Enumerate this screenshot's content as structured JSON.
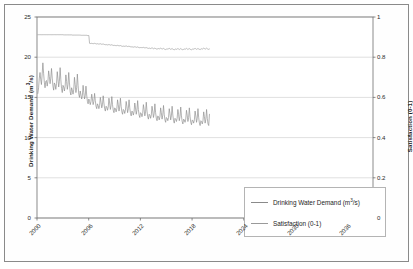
{
  "chart_data": {
    "type": "line",
    "title": "",
    "subtitle": "",
    "xlabel": "",
    "ylabel": "Drinking Water Demand (m³/s)",
    "ylabel_secondary": "Satisfaction (0-1)",
    "grid": true,
    "grid_axis": "y",
    "legend_position": "inside-bottom-right",
    "xlim": [
      2000,
      2039
    ],
    "ylim": [
      0,
      25
    ],
    "ylim_secondary": [
      0,
      1
    ],
    "yticks": [
      0,
      5,
      10,
      15,
      20,
      25
    ],
    "ytick_labels": [
      "0",
      "5",
      "10",
      "15",
      "20",
      "25"
    ],
    "yticks_secondary": [
      0,
      0.2,
      0.4,
      0.6,
      0.8,
      1
    ],
    "ytick_labels_secondary": [
      "0",
      "0.2",
      "0.4",
      "0.6",
      "0.8",
      "1"
    ],
    "xticks": [
      2000,
      2006,
      2012,
      2018,
      2024,
      2030,
      2036
    ],
    "xtick_labels": [
      "2000",
      "2006",
      "2012",
      "2018",
      "2024",
      "2030",
      "2036"
    ],
    "series": [
      {
        "name": "Drinking Water Demand (m³/s)",
        "axis": "left",
        "color": "#8a8a8a",
        "units": "m3/s",
        "x_start": 2000.1,
        "x_step": 0.08333,
        "note": "monthly values, strong annual seasonality, declining trend",
        "values": [
          15.5,
          16.2,
          17.4,
          18.1,
          17.2,
          16.6,
          17.9,
          19.3,
          18.0,
          16.9,
          16.2,
          17.0,
          17.1,
          16.4,
          17.0,
          18.3,
          17.6,
          16.7,
          17.4,
          18.6,
          17.4,
          16.4,
          15.9,
          16.8,
          16.6,
          16.0,
          16.7,
          18.2,
          17.3,
          16.3,
          17.0,
          18.7,
          17.2,
          16.1,
          15.6,
          16.5,
          16.3,
          15.8,
          16.4,
          17.8,
          17.0,
          16.0,
          16.6,
          18.1,
          16.8,
          15.7,
          15.3,
          16.2,
          15.9,
          15.4,
          16.0,
          17.5,
          16.6,
          15.6,
          16.2,
          17.9,
          16.5,
          15.4,
          15.0,
          15.8,
          15.3,
          14.8,
          15.2,
          16.5,
          15.6,
          14.8,
          15.2,
          16.4,
          15.3,
          14.5,
          14.2,
          14.8,
          14.5,
          14.1,
          14.5,
          15.4,
          14.8,
          14.1,
          14.5,
          15.5,
          14.6,
          13.9,
          13.6,
          14.2,
          14.0,
          13.6,
          14.0,
          15.0,
          14.4,
          13.7,
          14.1,
          15.2,
          14.3,
          13.6,
          13.3,
          13.9,
          13.8,
          13.4,
          13.8,
          14.9,
          14.3,
          13.5,
          14.0,
          15.1,
          14.1,
          13.4,
          13.1,
          13.7,
          13.6,
          13.2,
          13.6,
          14.7,
          14.1,
          13.3,
          13.8,
          14.9,
          13.9,
          13.2,
          12.9,
          13.5,
          13.4,
          13.0,
          13.4,
          14.5,
          13.9,
          13.1,
          13.6,
          14.7,
          13.7,
          13.0,
          12.7,
          13.3,
          13.2,
          12.8,
          13.2,
          14.3,
          13.7,
          12.9,
          13.4,
          14.6,
          13.5,
          12.8,
          12.5,
          13.1,
          13.0,
          12.6,
          13.0,
          14.1,
          13.5,
          12.7,
          13.2,
          14.4,
          13.3,
          12.6,
          12.3,
          12.9,
          12.8,
          12.4,
          12.8,
          13.9,
          13.3,
          12.5,
          13.0,
          14.2,
          13.1,
          12.4,
          12.1,
          12.7,
          12.6,
          12.2,
          12.6,
          13.7,
          13.1,
          12.3,
          12.8,
          14.0,
          12.9,
          12.2,
          11.9,
          12.5,
          12.4,
          12.1,
          12.5,
          13.6,
          13.0,
          12.2,
          12.7,
          13.9,
          12.8,
          12.1,
          11.8,
          12.4,
          12.3,
          12.0,
          12.4,
          13.5,
          12.9,
          12.1,
          12.6,
          13.8,
          12.7,
          12.0,
          11.7,
          12.3,
          12.2,
          11.9,
          12.3,
          13.4,
          12.8,
          12.0,
          12.5,
          13.7,
          12.6,
          11.9,
          11.6,
          12.2,
          12.1,
          11.8,
          12.2,
          13.3,
          12.7,
          11.9,
          12.4,
          13.6,
          12.5,
          11.8,
          11.5,
          12.1,
          12.0,
          11.7,
          12.1,
          13.2,
          12.6,
          11.8,
          12.3,
          13.5,
          12.4,
          11.7,
          11.5,
          12.9
        ]
      },
      {
        "name": "Satisfaction (0-1)",
        "axis": "right",
        "color": "#9a9a9a",
        "units": "0-1",
        "x_start": 2000.1,
        "x_step": 0.08333,
        "note": "near 0.91 flat until ~2005.8, step down to ~0.87, slow decline with small annual ripple settling near 0.84",
        "values": [
          0.912,
          0.912,
          0.912,
          0.912,
          0.912,
          0.912,
          0.912,
          0.912,
          0.912,
          0.912,
          0.912,
          0.912,
          0.912,
          0.912,
          0.912,
          0.912,
          0.912,
          0.912,
          0.912,
          0.912,
          0.912,
          0.912,
          0.912,
          0.912,
          0.912,
          0.912,
          0.912,
          0.912,
          0.912,
          0.912,
          0.912,
          0.912,
          0.912,
          0.912,
          0.912,
          0.912,
          0.911,
          0.911,
          0.911,
          0.911,
          0.911,
          0.911,
          0.911,
          0.911,
          0.911,
          0.911,
          0.911,
          0.911,
          0.91,
          0.91,
          0.91,
          0.91,
          0.91,
          0.91,
          0.91,
          0.91,
          0.91,
          0.91,
          0.91,
          0.91,
          0.909,
          0.909,
          0.909,
          0.909,
          0.909,
          0.909,
          0.909,
          0.909,
          0.909,
          0.908,
          0.908,
          0.908,
          0.869,
          0.868,
          0.868,
          0.869,
          0.868,
          0.867,
          0.868,
          0.869,
          0.868,
          0.866,
          0.866,
          0.867,
          0.866,
          0.865,
          0.866,
          0.867,
          0.866,
          0.864,
          0.865,
          0.866,
          0.864,
          0.863,
          0.862,
          0.863,
          0.862,
          0.861,
          0.862,
          0.863,
          0.862,
          0.86,
          0.861,
          0.862,
          0.86,
          0.859,
          0.858,
          0.859,
          0.858,
          0.857,
          0.858,
          0.859,
          0.858,
          0.856,
          0.857,
          0.858,
          0.856,
          0.855,
          0.854,
          0.855,
          0.855,
          0.854,
          0.855,
          0.856,
          0.855,
          0.853,
          0.854,
          0.855,
          0.853,
          0.852,
          0.851,
          0.852,
          0.851,
          0.85,
          0.851,
          0.852,
          0.851,
          0.849,
          0.85,
          0.851,
          0.849,
          0.848,
          0.847,
          0.848,
          0.848,
          0.847,
          0.848,
          0.849,
          0.848,
          0.846,
          0.847,
          0.848,
          0.846,
          0.845,
          0.844,
          0.845,
          0.845,
          0.843,
          0.845,
          0.846,
          0.845,
          0.842,
          0.844,
          0.845,
          0.843,
          0.841,
          0.84,
          0.842,
          0.843,
          0.841,
          0.843,
          0.845,
          0.843,
          0.84,
          0.842,
          0.844,
          0.841,
          0.839,
          0.838,
          0.84,
          0.842,
          0.84,
          0.842,
          0.844,
          0.842,
          0.839,
          0.841,
          0.843,
          0.84,
          0.838,
          0.837,
          0.839,
          0.841,
          0.839,
          0.841,
          0.843,
          0.841,
          0.838,
          0.84,
          0.843,
          0.84,
          0.838,
          0.837,
          0.839,
          0.841,
          0.839,
          0.841,
          0.844,
          0.841,
          0.838,
          0.841,
          0.843,
          0.84,
          0.838,
          0.837,
          0.839,
          0.842,
          0.84,
          0.842,
          0.844,
          0.842,
          0.839,
          0.841,
          0.844,
          0.841,
          0.839,
          0.838,
          0.84,
          0.842,
          0.84,
          0.843,
          0.845,
          0.843,
          0.84,
          0.842,
          0.845,
          0.842,
          0.84,
          0.839,
          0.841
        ]
      }
    ]
  },
  "legend": {
    "entries": [
      {
        "label_prefix": "Drinking Water Demand (m",
        "label_sup": "3",
        "label_suffix": "/s)",
        "color": "#8a8a8a"
      },
      {
        "label_prefix": "Satisfaction (0-1)",
        "label_sup": "",
        "label_suffix": "",
        "color": "#9a9a9a"
      }
    ]
  },
  "style": {
    "plot_border": "#6e6e6e",
    "grid_color": "#d2d2d2",
    "frame_color": "#8a8a8a",
    "text_color": "#1a1a1a",
    "background": "#ffffff"
  }
}
